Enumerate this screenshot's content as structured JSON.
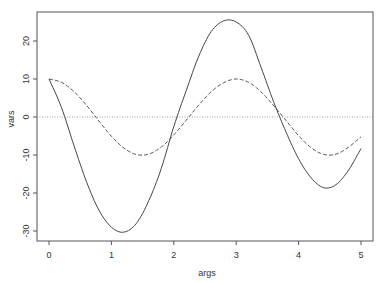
{
  "chart_data": {
    "type": "line",
    "title": "",
    "xlabel": "args",
    "ylabel": "vars",
    "xlim": [
      0,
      5
    ],
    "ylim": [
      -32,
      28
    ],
    "grid": false,
    "legend": null,
    "x_ticks": [
      0,
      1,
      2,
      3,
      4,
      5
    ],
    "x_tick_labels": [
      "0",
      "1",
      "2",
      "3",
      "4",
      "5"
    ],
    "y_ticks": [
      -30,
      -20,
      -10,
      0,
      10,
      20
    ],
    "y_tick_labels": [
      "-30",
      "-20",
      "-10",
      "0",
      "10",
      "20"
    ],
    "x": [
      0,
      0.2,
      0.4,
      0.6,
      0.8,
      1.0,
      1.2,
      1.4,
      1.6,
      1.8,
      2.0,
      2.2,
      2.4,
      2.6,
      2.8,
      3.0,
      3.2,
      3.4,
      3.6,
      3.8,
      4.0,
      4.2,
      4.4,
      4.6,
      4.8,
      5.0
    ],
    "series": [
      {
        "name": "solid",
        "style": "solid",
        "color": "#444444",
        "values": [
          10,
          2.5,
          -7.5,
          -17,
          -24.5,
          -29,
          -30.3,
          -28,
          -22,
          -13.5,
          -2.5,
          7,
          16,
          22.5,
          25.3,
          25,
          21.5,
          13,
          4,
          -4,
          -11,
          -16,
          -18.6,
          -17.8,
          -14,
          -8.3
        ]
      },
      {
        "name": "dashed",
        "style": "dashed",
        "color": "#555555",
        "values": [
          10,
          9.13,
          6.69,
          3.09,
          -1.05,
          -5.05,
          -8.18,
          -9.86,
          -9.75,
          -7.9,
          -4.69,
          -0.83,
          3.16,
          6.66,
          9.03,
          9.99,
          9.12,
          6.58,
          3.0,
          -0.95,
          -4.91,
          -8.07,
          -9.83,
          -9.76,
          -7.95,
          -5.2
        ]
      }
    ],
    "reference_lines": [
      {
        "orientation": "horizontal",
        "value": 0,
        "style": "dotted",
        "color": "#888888"
      }
    ]
  },
  "labels": {
    "xlabel": "args",
    "ylabel": "vars"
  }
}
